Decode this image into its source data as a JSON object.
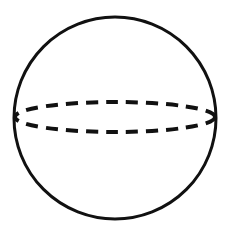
{
  "diagram": {
    "type": "sphere",
    "colors": {
      "stroke": "#111111",
      "background": "#ffffff"
    },
    "circle": {
      "cx": 115,
      "cy": 118,
      "r": 101
    },
    "equator": {
      "cx": 115,
      "cy": 117,
      "rx": 100,
      "ry": 15,
      "dashed": true
    }
  }
}
